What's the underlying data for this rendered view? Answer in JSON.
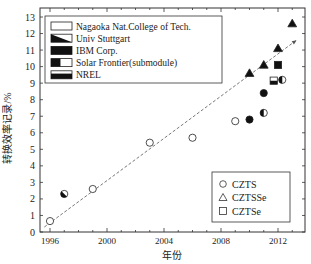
{
  "chart_data": {
    "type": "scatter",
    "title": "",
    "xlabel": "年份",
    "ylabel": "转换效率记录/%",
    "xlim": [
      1995.0,
      2014.0
    ],
    "ylim": [
      0,
      13.5
    ],
    "x_ticks": [
      1996,
      2000,
      2004,
      2008,
      2012
    ],
    "y_ticks": [
      0,
      1,
      2,
      3,
      4,
      5,
      6,
      7,
      8,
      9,
      10,
      11,
      12,
      13
    ],
    "grid": false,
    "legend_institutions": {
      "position": "upper-left",
      "entries": [
        {
          "label": "Nagaoka Nat.College of Tech.",
          "fill": "open"
        },
        {
          "label": "Univ Stuttgart",
          "fill": "diagonal"
        },
        {
          "label": "IBM Corp.",
          "fill": "full"
        },
        {
          "label": "Solar Frontier(submodule)",
          "fill": "left-half"
        },
        {
          "label": "NREL",
          "fill": "bottom-half"
        }
      ]
    },
    "legend_materials": {
      "position": "lower-right",
      "entries": [
        {
          "label": "CZTS",
          "marker": "circle"
        },
        {
          "label": "CZTSSe",
          "marker": "triangle"
        },
        {
          "label": "CZTSe",
          "marker": "square"
        }
      ]
    },
    "series": [
      {
        "name": "CZTS",
        "marker": "circle",
        "points": [
          {
            "x": 1996.0,
            "y": 0.66,
            "fill": "open"
          },
          {
            "x": 1997.0,
            "y": 2.3,
            "fill": "diagonal"
          },
          {
            "x": 1999.0,
            "y": 2.6,
            "fill": "open"
          },
          {
            "x": 2003.0,
            "y": 5.4,
            "fill": "open"
          },
          {
            "x": 2006.0,
            "y": 5.7,
            "fill": "open"
          },
          {
            "x": 2009.0,
            "y": 6.7,
            "fill": "open"
          },
          {
            "x": 2010.0,
            "y": 6.8,
            "fill": "full"
          },
          {
            "x": 2011.0,
            "y": 8.4,
            "fill": "full"
          },
          {
            "x": 2011.0,
            "y": 7.2,
            "fill": "left-half"
          },
          {
            "x": 2012.3,
            "y": 9.2,
            "fill": "left-half"
          }
        ]
      },
      {
        "name": "CZTSSe",
        "marker": "triangle",
        "points": [
          {
            "x": 2010.0,
            "y": 9.6,
            "fill": "full"
          },
          {
            "x": 2011.0,
            "y": 10.1,
            "fill": "full"
          },
          {
            "x": 2012.0,
            "y": 11.1,
            "fill": "full"
          },
          {
            "x": 2013.0,
            "y": 12.6,
            "fill": "full"
          }
        ]
      },
      {
        "name": "CZTSe",
        "marker": "square",
        "points": [
          {
            "x": 2012.0,
            "y": 10.1,
            "fill": "full"
          },
          {
            "x": 2011.7,
            "y": 9.15,
            "fill": "bottom-half"
          }
        ]
      }
    ],
    "trend_line": {
      "style": "dashed",
      "from": {
        "x": 1995.6,
        "y": 0.3
      },
      "to": {
        "x": 2013.3,
        "y": 11.6
      }
    }
  }
}
